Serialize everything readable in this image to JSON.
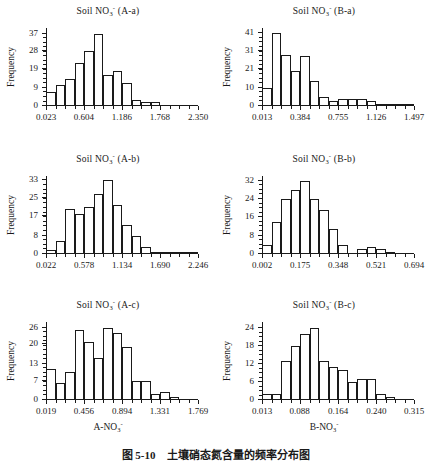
{
  "figure": {
    "caption_number": "图 5-10",
    "caption_text": "土壤硝态氮含量的频率分布图",
    "y_axis_title": "Frequency"
  },
  "chart_data": [
    {
      "type": "bar",
      "id": "A-a",
      "title": "Soil NO3- (A-a)",
      "title_base": "Soil NO",
      "title_sub": "3",
      "title_sup": "-",
      "title_suffix": " (A-a)",
      "xlabel": "",
      "ylabel": "Frequency",
      "ylim": [
        0,
        40
      ],
      "ytick_labels": [
        "0",
        "9",
        "19",
        "28",
        "37"
      ],
      "ytick_values": [
        0,
        9,
        19,
        28,
        37
      ],
      "xlim": [
        0.023,
        2.35
      ],
      "xtick_labels": [
        "0.023",
        "0.604",
        "1.186",
        "1.768",
        "2.350"
      ],
      "xtick_values": [
        0.023,
        0.604,
        1.186,
        1.768,
        2.35
      ],
      "bin_width": 0.1453,
      "categories": [
        "0.023-0.168",
        "0.168-0.314",
        "0.314-0.459",
        "0.459-0.604",
        "0.604-0.750",
        "0.750-0.895",
        "0.895-1.041",
        "1.041-1.186",
        "1.186-1.331",
        "1.331-1.477",
        "1.477-1.622",
        "1.622-1.768",
        "1.768-1.913",
        "1.913-2.059",
        "2.059-2.204",
        "2.204-2.350"
      ],
      "values": [
        7,
        11,
        14,
        22,
        28,
        37,
        16,
        18,
        12,
        3,
        2,
        2,
        0,
        0,
        0,
        0
      ]
    },
    {
      "type": "bar",
      "id": "B-a",
      "title": "Soil NO3- (B-a)",
      "title_base": "Soil NO",
      "title_sub": "3",
      "title_sup": "-",
      "title_suffix": " (B-a)",
      "xlabel": "",
      "ylabel": "Frequency",
      "ylim": [
        0,
        44
      ],
      "ytick_labels": [
        "0",
        "10",
        "21",
        "31",
        "41"
      ],
      "ytick_values": [
        0,
        10,
        21,
        31,
        41
      ],
      "xlim": [
        0.013,
        1.497
      ],
      "xtick_labels": [
        "0.013",
        "0.384",
        "0.755",
        "1.126",
        "1.497"
      ],
      "xtick_values": [
        0.013,
        0.384,
        0.755,
        1.126,
        1.497
      ],
      "bin_width": 0.0928,
      "categories": [
        "0.013-0.106",
        "0.106-0.198",
        "0.198-0.291",
        "0.291-0.384",
        "0.384-0.477",
        "0.477-0.569",
        "0.569-0.662",
        "0.662-0.755",
        "0.755-0.848",
        "0.848-0.940",
        "0.940-1.033",
        "1.033-1.126",
        "1.126-1.218",
        "1.218-1.311",
        "1.311-1.404",
        "1.404-1.497"
      ],
      "values": [
        10,
        41,
        29,
        20,
        28,
        14,
        5,
        3,
        4,
        4,
        4,
        3,
        1,
        1,
        1,
        1
      ]
    },
    {
      "type": "bar",
      "id": "A-b",
      "title": "Soil NO3- (A-b)",
      "title_base": "Soil NO",
      "title_sub": "3",
      "title_sup": "-",
      "title_suffix": " (A-b)",
      "xlabel": "",
      "ylabel": "Frequency",
      "ylim": [
        0,
        35
      ],
      "ytick_labels": [
        "0",
        "8",
        "17",
        "25",
        "33"
      ],
      "ytick_values": [
        0,
        8,
        17,
        25,
        33
      ],
      "xlim": [
        0.022,
        2.246
      ],
      "xtick_labels": [
        "0.022",
        "0.578",
        "1.134",
        "1.690",
        "2.246"
      ],
      "xtick_values": [
        0.022,
        0.578,
        1.134,
        1.69,
        2.246
      ],
      "bin_width": 0.139,
      "categories": [
        "0.022-0.161",
        "0.161-0.300",
        "0.300-0.439",
        "0.439-0.578",
        "0.578-0.717",
        "0.717-0.856",
        "0.856-0.995",
        "0.995-1.134",
        "1.134-1.273",
        "1.273-1.412",
        "1.412-1.551",
        "1.551-1.690",
        "1.690-1.829",
        "1.829-1.968",
        "1.968-2.107",
        "2.107-2.246"
      ],
      "values": [
        2,
        6,
        20,
        18,
        21,
        27,
        33,
        22,
        13,
        8,
        3,
        1,
        1,
        1,
        1,
        1
      ]
    },
    {
      "type": "bar",
      "id": "B-b",
      "title": "Soil NO3- (B-b)",
      "title_base": "Soil NO",
      "title_sub": "3",
      "title_sup": "-",
      "title_suffix": " (B-b)",
      "xlabel": "",
      "ylabel": "Frequency",
      "ylim": [
        0,
        34
      ],
      "ytick_labels": [
        "0",
        "8",
        "16",
        "24",
        "32"
      ],
      "ytick_values": [
        0,
        8,
        16,
        24,
        32
      ],
      "xlim": [
        0.002,
        0.694
      ],
      "xtick_labels": [
        "0.002",
        "0.175",
        "0.348",
        "0.521",
        "0.694"
      ],
      "xtick_values": [
        0.002,
        0.175,
        0.348,
        0.521,
        0.694
      ],
      "bin_width": 0.0433,
      "categories": [
        "0.002-0.045",
        "0.045-0.088",
        "0.088-0.132",
        "0.132-0.175",
        "0.175-0.218",
        "0.218-0.261",
        "0.261-0.305",
        "0.305-0.348",
        "0.348-0.391",
        "0.391-0.434",
        "0.434-0.478",
        "0.478-0.521",
        "0.521-0.564",
        "0.564-0.607",
        "0.607-0.651",
        "0.651-0.694"
      ],
      "values": [
        4,
        14,
        24,
        28,
        32,
        24,
        19,
        11,
        4,
        0,
        2,
        3,
        2,
        1,
        0,
        0
      ]
    },
    {
      "type": "bar",
      "id": "A-c",
      "title": "Soil NO3- (A-c)",
      "title_base": "Soil NO",
      "title_sub": "3",
      "title_sup": "-",
      "title_suffix": " (A-c)",
      "xlabel": "A-NO3-",
      "xlabel_base": "A-NO",
      "xlabel_sub": "3",
      "xlabel_sup": "-",
      "ylabel": "Frequency",
      "ylim": [
        0,
        28
      ],
      "ytick_labels": [
        "0",
        "7",
        "13",
        "20",
        "26"
      ],
      "ytick_values": [
        0,
        7,
        13,
        20,
        26
      ],
      "xlim": [
        0.019,
        1.769
      ],
      "xtick_labels": [
        "0.019",
        "0.456",
        "0.894",
        "1.331",
        "1.769"
      ],
      "xtick_values": [
        0.019,
        0.456,
        0.894,
        1.331,
        1.769
      ],
      "bin_width": 0.1094,
      "categories": [
        "0.019-0.128",
        "0.128-0.238",
        "0.238-0.347",
        "0.347-0.456",
        "0.456-0.566",
        "0.566-0.675",
        "0.675-0.784",
        "0.784-0.894",
        "0.894-1.003",
        "1.003-1.113",
        "1.113-1.222",
        "1.222-1.331",
        "1.331-1.441",
        "1.441-1.550",
        "1.550-1.660",
        "1.660-1.769"
      ],
      "values": [
        11,
        6,
        10,
        25,
        21,
        15,
        26,
        24,
        19,
        7,
        7,
        2,
        3,
        1,
        0,
        0
      ]
    },
    {
      "type": "bar",
      "id": "B-c",
      "title": "Soil NO3- (B-c)",
      "title_base": "Soil NO",
      "title_sub": "3",
      "title_sup": "-",
      "title_suffix": " (B-c)",
      "xlabel": "B-NO3-",
      "xlabel_base": "B-NO",
      "xlabel_sub": "3",
      "xlabel_sup": "-",
      "ylabel": "Frequency",
      "ylim": [
        0,
        26
      ],
      "ytick_labels": [
        "0",
        "6",
        "12",
        "18",
        "24"
      ],
      "ytick_values": [
        0,
        6,
        12,
        18,
        24
      ],
      "xlim": [
        0.013,
        0.315
      ],
      "xtick_labels": [
        "0.013",
        "0.088",
        "0.164",
        "0.240",
        "0.315"
      ],
      "xtick_values": [
        0.013,
        0.088,
        0.164,
        0.24,
        0.315
      ],
      "bin_width": 0.0189,
      "categories": [
        "0.013-0.032",
        "0.032-0.051",
        "0.051-0.070",
        "0.070-0.088",
        "0.088-0.107",
        "0.107-0.126",
        "0.126-0.145",
        "0.145-0.164",
        "0.164-0.183",
        "0.183-0.202",
        "0.202-0.221",
        "0.221-0.240",
        "0.240-0.258",
        "0.258-0.277",
        "0.277-0.296",
        "0.296-0.315"
      ],
      "values": [
        2,
        2,
        13,
        18,
        22,
        24,
        13,
        11,
        10,
        6,
        7,
        7,
        2,
        1,
        0,
        0
      ]
    }
  ]
}
